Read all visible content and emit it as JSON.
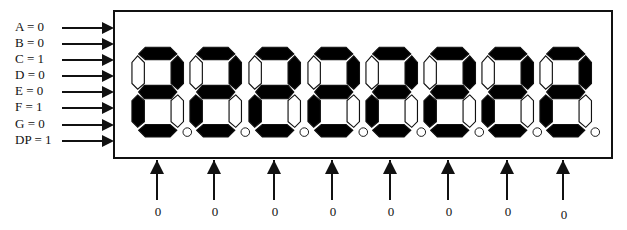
{
  "diagram": {
    "title": "",
    "logic": "active-low (0 = segment lit)",
    "inputs": [
      {
        "name": "A",
        "label": "A = 0",
        "value": 0
      },
      {
        "name": "B",
        "label": "B = 0",
        "value": 0
      },
      {
        "name": "C",
        "label": "C = 1",
        "value": 1
      },
      {
        "name": "D",
        "label": "D = 0",
        "value": 0
      },
      {
        "name": "E",
        "label": "E = 0",
        "value": 0
      },
      {
        "name": "F",
        "label": "F = 1",
        "value": 1
      },
      {
        "name": "G",
        "label": "G = 0",
        "value": 0
      },
      {
        "name": "DP",
        "label": "DP = 1",
        "value": 1
      }
    ],
    "displayed_character": "2",
    "digit_count": 8,
    "digit_selects": [
      {
        "label": "0"
      },
      {
        "label": "0"
      },
      {
        "label": "0"
      },
      {
        "label": "0"
      },
      {
        "label": "0"
      },
      {
        "label": "0"
      },
      {
        "label": "0"
      },
      {
        "label": "0"
      }
    ],
    "colors": {
      "on": "#000000",
      "off": "#ffffff",
      "stroke": "#111111"
    }
  }
}
